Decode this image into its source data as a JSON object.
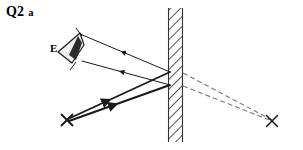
{
  "page": {
    "title": "Q2",
    "part": "a",
    "background_color": "#ffffff",
    "ink_color": "#1a1a1a"
  },
  "labels": {
    "eye": "E"
  },
  "diagram": {
    "type": "ray-diagram",
    "mirror": {
      "name": "plane-mirror",
      "x_left": 168,
      "x_right": 183,
      "y_top": 8,
      "y_bottom": 142,
      "hatch_angle_deg": 45,
      "hatch_color": "#555555",
      "edge_color": "#333333"
    },
    "object": {
      "name": "object-point",
      "marker": "cross",
      "x": 67,
      "y": 120,
      "size": 11
    },
    "image": {
      "name": "virtual-image-point",
      "marker": "cross",
      "x": 272,
      "y": 121,
      "size": 11
    },
    "eye": {
      "name": "eye-symbol",
      "apex_x": 80,
      "apex_y": 33,
      "cone_points": "80,33 58,52 72,63 84,45",
      "pupil": "78,36 69,55 76,60 82,43"
    },
    "incident_rays": [
      {
        "name": "incident-ray-upper",
        "from_x": 68,
        "from_y": 119,
        "to_x": 170,
        "to_y": 72,
        "arrow_t": 0.38,
        "arrow_dir": "toward-object"
      },
      {
        "name": "incident-ray-lower",
        "from_x": 69,
        "from_y": 121,
        "to_x": 170,
        "to_y": 85,
        "arrow_t": 0.44,
        "arrow_dir": "toward-object"
      }
    ],
    "reflected_rays": [
      {
        "name": "reflected-ray-upper",
        "from_x": 170,
        "from_y": 72,
        "to_x": 80,
        "to_y": 34,
        "arrow_t": 0.52,
        "arrow_dir": "toward-eye"
      },
      {
        "name": "reflected-ray-lower",
        "from_x": 170,
        "from_y": 85,
        "to_x": 82,
        "to_y": 61,
        "arrow_t": 0.55,
        "arrow_dir": "toward-eye"
      }
    ],
    "virtual_rays": [
      {
        "name": "virtual-ray-upper",
        "from_x": 183,
        "from_y": 73,
        "to_x": 272,
        "to_y": 120,
        "dash": "5,3"
      },
      {
        "name": "virtual-ray-lower",
        "from_x": 183,
        "from_y": 86,
        "to_x": 272,
        "to_y": 121,
        "dash": "5,3"
      }
    ]
  }
}
